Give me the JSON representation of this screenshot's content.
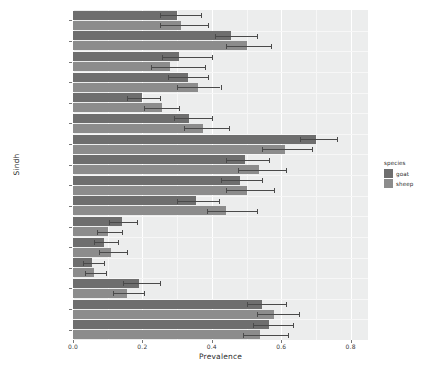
{
  "chart_data": {
    "type": "bar",
    "orientation": "horizontal",
    "title": "",
    "xlabel": "Prevalence",
    "ylabel": "Sindh",
    "xlim": [
      0.0,
      0.85
    ],
    "xticks": [
      0.0,
      0.2,
      0.4,
      0.6,
      0.8
    ],
    "xtick_labels": [
      "0.0",
      "0.2",
      "0.4",
      "0.6",
      "0.8"
    ],
    "grid": true,
    "legend": {
      "title": "species",
      "position": "right",
      "entries": [
        {
          "name": "goat",
          "color": "#6e6e6e"
        },
        {
          "name": "sheep",
          "color": "#8c8c8c"
        }
      ]
    },
    "categories": [
      "Thatta",
      "Sukkur",
      "Shikarpur",
      "Sanghar",
      "Nawabshah",
      "Nausheroferoz",
      "Matiari",
      "Mirpur khas",
      "Larkana",
      "Khairpur",
      "Karachi",
      "Jacobabad",
      "Hyderabad",
      "Ghotki",
      "Dadu",
      "Badin"
    ],
    "series": [
      {
        "name": "goat",
        "color": "#6e6e6e",
        "values": [
          0.3,
          0.455,
          0.305,
          0.33,
          0.2,
          0.335,
          0.7,
          0.495,
          0.48,
          0.355,
          0.14,
          0.09,
          0.055,
          0.19,
          0.545,
          0.565
        ],
        "err_low": [
          0.25,
          0.41,
          0.255,
          0.275,
          0.155,
          0.29,
          0.655,
          0.44,
          0.425,
          0.3,
          0.105,
          0.06,
          0.03,
          0.145,
          0.5,
          0.52
        ],
        "err_high": [
          0.37,
          0.53,
          0.4,
          0.39,
          0.25,
          0.4,
          0.76,
          0.565,
          0.545,
          0.42,
          0.185,
          0.13,
          0.09,
          0.25,
          0.615,
          0.635
        ]
      },
      {
        "name": "sheep",
        "color": "#8c8c8c",
        "values": [
          0.31,
          0.5,
          0.28,
          0.36,
          0.255,
          0.375,
          0.61,
          0.535,
          0.5,
          0.44,
          0.1,
          0.11,
          0.06,
          0.155,
          0.58,
          0.54
        ],
        "err_low": [
          0.25,
          0.44,
          0.225,
          0.3,
          0.205,
          0.32,
          0.545,
          0.475,
          0.44,
          0.385,
          0.07,
          0.075,
          0.035,
          0.115,
          0.53,
          0.49
        ],
        "err_high": [
          0.39,
          0.57,
          0.38,
          0.425,
          0.305,
          0.45,
          0.69,
          0.615,
          0.58,
          0.53,
          0.14,
          0.155,
          0.095,
          0.205,
          0.65,
          0.62
        ]
      }
    ]
  },
  "panel": {
    "background": "#eceded",
    "grid_color": "#ffffff"
  }
}
